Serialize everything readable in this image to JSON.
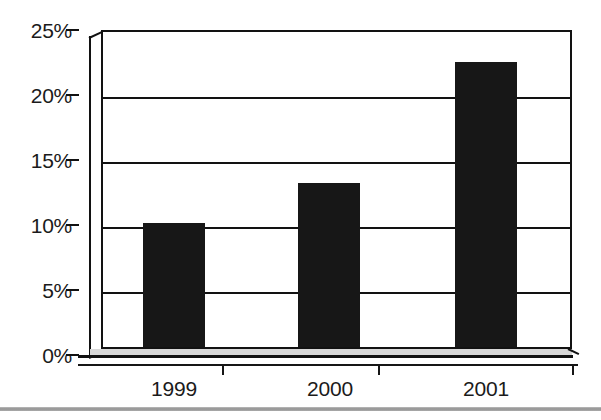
{
  "figure": {
    "background_color": "#ffffff",
    "ink_color": "#171717",
    "artifact_rule_color": "#8e8e8e"
  },
  "chart_data": {
    "type": "bar",
    "title": "",
    "subtitle": "",
    "xlabel": "",
    "ylabel": "",
    "categories": [
      "1999",
      "2000",
      "2001"
    ],
    "values": [
      10.3,
      13.4,
      22.7
    ],
    "series": [
      {
        "name": "",
        "values": [
          10.3,
          13.4,
          22.7
        ],
        "color": "#171717"
      }
    ],
    "ylim": [
      0,
      25
    ],
    "yticks": [
      0,
      5,
      10,
      15,
      20,
      25
    ],
    "ytick_labels": [
      "0%",
      "5%",
      "10%",
      "15%",
      "20%",
      "25%"
    ],
    "xtick_labels": [
      "1999",
      "2000",
      "2001"
    ],
    "value_format": "percent",
    "grid": true,
    "grid_axis": "y",
    "legend": false,
    "legend_position": "none",
    "bar_color": "#171717",
    "style": "3d-perspective-axis",
    "annotations": []
  },
  "axis": {
    "y_labels": [
      {
        "text": "25%",
        "value": 25
      },
      {
        "text": "20%",
        "value": 20
      },
      {
        "text": "15%",
        "value": 15
      },
      {
        "text": "10%",
        "value": 10
      },
      {
        "text": "5%",
        "value": 5
      },
      {
        "text": "0%",
        "value": 0
      }
    ],
    "x_labels": [
      {
        "text": "1999"
      },
      {
        "text": "2000"
      },
      {
        "text": "2001"
      }
    ]
  }
}
